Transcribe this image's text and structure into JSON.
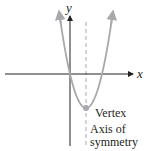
{
  "diagram": {
    "type": "parabola-graph",
    "axes": {
      "x_label": "x",
      "y_label": "y"
    },
    "curve": {
      "kind": "parabola",
      "opens": "up",
      "color": "#a7a9ac"
    },
    "vertex": {
      "label": "Vertex",
      "color": "#a7a9ac"
    },
    "axis_of_symmetry": {
      "label_line1": "Axis of",
      "label_line2": "symmetry",
      "style": "dashed"
    },
    "colors": {
      "axes": "#231f20",
      "curve": "#a7a9ac",
      "text": "#231f20"
    }
  }
}
